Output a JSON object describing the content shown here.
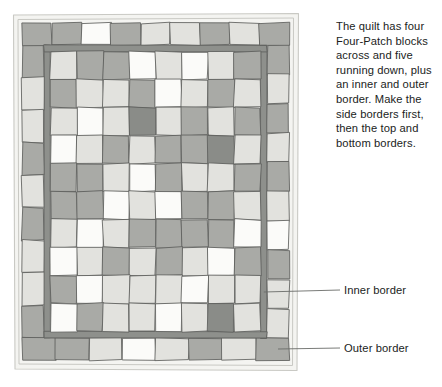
{
  "figure": {
    "instruction_text": "The quilt has four Four-Patch blocks across and five running down, plus an inner and outer border. Make the side borders first, then the top and bottom borders.",
    "callouts": [
      {
        "id": "inner-border",
        "label": "Inner border"
      },
      {
        "id": "outer-border",
        "label": "Outer border"
      }
    ]
  },
  "palette": {
    "white": "#fbfbf9",
    "light": "#e2e2de",
    "light_alt": "#d6d6d1",
    "medium": "#a9aaa6",
    "medium_dark": "#9a9b97",
    "dark": "#8a8c88",
    "inner_border": "#8e908c",
    "outline": "#5d5f5c",
    "leader": "#6a6c69",
    "backing": "#f4f4f1",
    "backing_edge": "#c9c9c4"
  },
  "quilt": {
    "blocks_across": 4,
    "blocks_down": 5,
    "patches_across": 8,
    "patches_down": 10,
    "has_inner_border": true,
    "has_outer_border": true,
    "inner_grid_tones": [
      [
        "light",
        "medium",
        "medium",
        "white",
        "light",
        "white",
        "light",
        "medium"
      ],
      [
        "medium",
        "light",
        "light",
        "medium",
        "white",
        "light",
        "medium",
        "light"
      ],
      [
        "light",
        "white",
        "light",
        "dark",
        "light",
        "medium",
        "light",
        "medium"
      ],
      [
        "white",
        "light",
        "medium",
        "light",
        "medium",
        "medium",
        "dark",
        "light"
      ],
      [
        "medium",
        "medium",
        "light",
        "white",
        "medium",
        "light",
        "light",
        "medium"
      ],
      [
        "medium",
        "medium",
        "white",
        "light",
        "white",
        "medium",
        "medium",
        "light"
      ],
      [
        "light",
        "white",
        "light",
        "medium",
        "medium",
        "medium",
        "medium",
        "white"
      ],
      [
        "white",
        "light",
        "medium",
        "light",
        "medium",
        "light",
        "white",
        "medium"
      ],
      [
        "medium",
        "white",
        "light",
        "light",
        "light",
        "white",
        "light",
        "light"
      ],
      [
        "white",
        "medium",
        "light",
        "light",
        "white",
        "light",
        "dark",
        "light"
      ]
    ],
    "outer_border_top_tones": [
      "medium",
      "medium",
      "white",
      "medium",
      "light",
      "light",
      "medium",
      "light",
      "medium"
    ],
    "outer_border_bottom_tones": [
      "medium",
      "medium",
      "light",
      "white",
      "light",
      "medium",
      "light",
      "medium"
    ],
    "outer_border_left_tones": [
      "medium",
      "light",
      "light",
      "medium",
      "light",
      "medium",
      "light",
      "light",
      "medium"
    ],
    "outer_border_right_tones": [
      "medium",
      "light",
      "medium",
      "light",
      "medium",
      "light",
      "white",
      "medium",
      "light",
      "light"
    ]
  }
}
